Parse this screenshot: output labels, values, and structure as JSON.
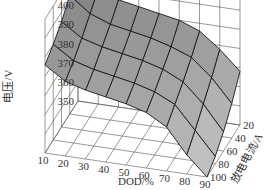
{
  "chart_data": {
    "type": "surface3d",
    "title": "",
    "xlabel": "DOD/%",
    "ylabel": "放电电流/A",
    "zlabel": "电压/V",
    "x_ticks": [
      "10",
      "20",
      "30",
      "40",
      "50",
      "60",
      "70",
      "80",
      "90"
    ],
    "y_ticks": [
      "20",
      "40",
      "60",
      "80",
      "100"
    ],
    "z_ticks": [
      "350",
      "360",
      "370",
      "380",
      "390",
      "400",
      "410",
      "420"
    ],
    "zlim": [
      350,
      420
    ],
    "grid": true,
    "x": [
      10,
      20,
      30,
      40,
      50,
      60,
      70,
      80,
      90
    ],
    "y": [
      20,
      40,
      60,
      80,
      100
    ],
    "z": [
      [
        420,
        410,
        406,
        404,
        402,
        400,
        396,
        388,
        378
      ],
      [
        412,
        404,
        400,
        398,
        396,
        393,
        389,
        380,
        368
      ],
      [
        405,
        398,
        395,
        393,
        391,
        388,
        383,
        373,
        360
      ],
      [
        400,
        393,
        390,
        388,
        386,
        383,
        378,
        366,
        354
      ],
      [
        396,
        389,
        386,
        384,
        382,
        379,
        373,
        360,
        350
      ]
    ],
    "colors": {
      "surface_dark": "#8a8a8a",
      "surface_mid": "#a8a8a8",
      "surface_light": "#cfcfcf",
      "grid": "#555555",
      "edge": "#1a1a1a"
    }
  }
}
